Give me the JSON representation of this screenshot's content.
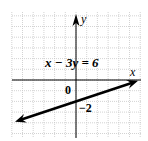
{
  "chart_data": {
    "type": "line",
    "title": "",
    "equation_label": "x − 3y = 6",
    "xlabel": "x",
    "ylabel": "y",
    "origin_label": "0",
    "y_intercept_label": "−2",
    "xlim": [
      -6,
      6
    ],
    "ylim": [
      -5.4,
      6.2
    ],
    "grid": true,
    "grid_step": 1,
    "series": [
      {
        "name": "x − 3y = 6",
        "equation": "y = (x - 6) / 3",
        "x": [
          -5.7,
          5.8
        ],
        "y": [
          -3.9,
          -0.07
        ],
        "arrows_both_ends": true
      }
    ],
    "annotations": [
      {
        "text": "0",
        "x": -0.6,
        "y": -0.9
      },
      {
        "text": "−2",
        "x": 0.5,
        "y": -2
      }
    ]
  },
  "colors": {
    "grid": "#c8c8c8",
    "axis": "#000000",
    "line": "#000000",
    "background": "#ffffff"
  }
}
